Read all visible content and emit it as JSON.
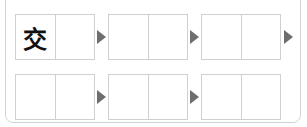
{
  "puzzle": {
    "rows": [
      {
        "groups": [
          {
            "cells": [
              "交",
              ""
            ]
          },
          {
            "cells": [
              "",
              ""
            ]
          },
          {
            "cells": [
              "",
              ""
            ]
          }
        ],
        "trailing_arrow": true
      },
      {
        "groups": [
          {
            "cells": [
              "",
              ""
            ]
          },
          {
            "cells": [
              "",
              ""
            ]
          },
          {
            "cells": [
              "",
              ""
            ]
          }
        ],
        "trailing_arrow": false
      }
    ],
    "arrow_icon": "triangle-right-icon",
    "colors": {
      "border": "#d0d0d0",
      "arrow": "#6e6e6e",
      "text": "#111111"
    }
  }
}
